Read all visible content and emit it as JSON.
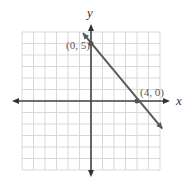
{
  "chart_data": {
    "type": "line",
    "title": "",
    "xlabel": "x",
    "ylabel": "y",
    "xlim": [
      -6,
      6
    ],
    "ylim": [
      -6,
      6
    ],
    "grid": true,
    "series": [
      {
        "name": "line",
        "x": [
          -0.7,
          6.2
        ],
        "y": [
          5.9,
          -2.4
        ],
        "color": "#555555"
      }
    ],
    "points": [
      {
        "x": 0,
        "y": 5,
        "label": "(0, 5)"
      },
      {
        "x": 4,
        "y": 0,
        "label": "(4, 0)"
      }
    ]
  },
  "labels": {
    "x_axis": "x",
    "y_axis": "y",
    "point_a": "(0, 5)",
    "point_b": "(4, 0)"
  }
}
